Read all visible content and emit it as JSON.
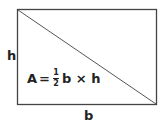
{
  "diagram": {
    "height_label": "h",
    "base_label": "b",
    "formula": {
      "lhs": "A",
      "equals": "=",
      "numerator": "1",
      "denominator": "2",
      "rest": "b × h"
    }
  }
}
